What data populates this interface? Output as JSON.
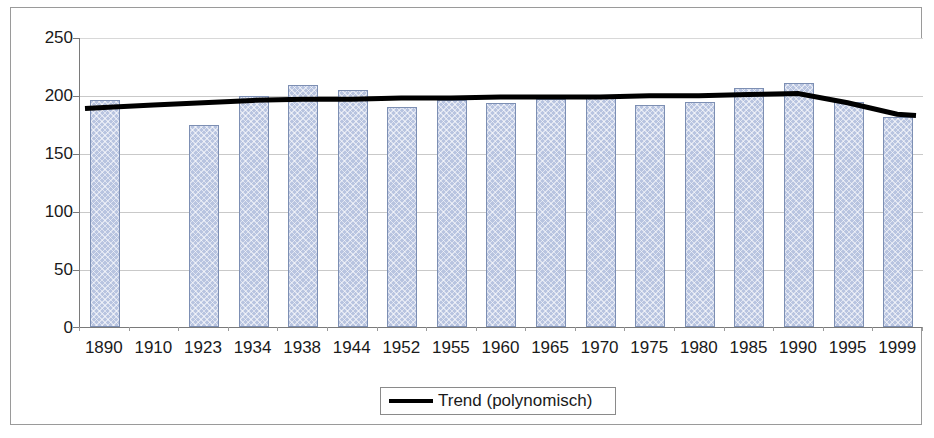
{
  "chart_data": {
    "type": "bar",
    "title": "",
    "subtitle": "",
    "xlabel": "",
    "ylabel": "",
    "ylim": [
      0,
      250
    ],
    "yticks": [
      0,
      50,
      100,
      150,
      200,
      250
    ],
    "grid": true,
    "legend_position": "bottom-center",
    "categories": [
      "1890",
      "1910",
      "1923",
      "1934",
      "1938",
      "1944",
      "1952",
      "1955",
      "1960",
      "1965",
      "1970",
      "1975",
      "1980",
      "1985",
      "1990",
      "1995",
      "1999"
    ],
    "series": [
      {
        "name": "Werte",
        "chart_type": "bar",
        "color": "#b8c4e0",
        "border_color": "#7d8fb3",
        "values": [
          196,
          null,
          175,
          200,
          209,
          205,
          190,
          196,
          194,
          197,
          198,
          192,
          195,
          207,
          211,
          195,
          182
        ]
      },
      {
        "name": "Trend (polynomisch)",
        "chart_type": "line",
        "color": "#000000",
        "values": [
          190,
          192,
          194,
          196,
          197,
          197,
          198,
          198,
          199,
          199,
          199,
          200,
          200,
          201,
          202,
          194,
          184
        ]
      }
    ],
    "legend": [
      {
        "label": "Trend (polynomisch)",
        "marker": "line",
        "color": "#000000"
      }
    ]
  }
}
